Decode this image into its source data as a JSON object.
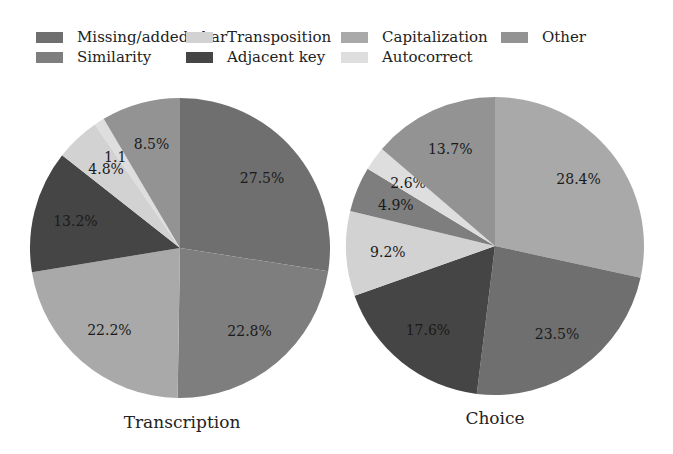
{
  "chart_data": [
    {
      "type": "pie",
      "title": "Transcription",
      "start_angle_deg": 90,
      "direction": "clockwise",
      "slices": [
        {
          "label": "Missing/added char",
          "value": 27.5,
          "text": "27.5%"
        },
        {
          "label": "Similarity",
          "value": 22.8,
          "text": "22.8%"
        },
        {
          "label": "Capitalization",
          "value": 22.2,
          "text": "22.2%"
        },
        {
          "label": "Adjacent key",
          "value": 13.2,
          "text": "13.2%"
        },
        {
          "label": "Transposition",
          "value": 4.8,
          "text": "4.8%"
        },
        {
          "label": "Autocorrect",
          "value": 1.1,
          "text": "1.1%"
        },
        {
          "label": "Other",
          "value": 8.5,
          "text": "8.5%"
        }
      ]
    },
    {
      "type": "pie",
      "title": "Choice",
      "start_angle_deg": 90,
      "direction": "clockwise",
      "slices": [
        {
          "label": "Capitalization",
          "value": 28.4,
          "text": "28.4%"
        },
        {
          "label": "Missing/added char",
          "value": 23.5,
          "text": "23.5%"
        },
        {
          "label": "Adjacent key",
          "value": 17.6,
          "text": "17.6%"
        },
        {
          "label": "Transposition",
          "value": 9.2,
          "text": "9.2%"
        },
        {
          "label": "Similarity",
          "value": 4.9,
          "text": "4.9%"
        },
        {
          "label": "Autocorrect",
          "value": 2.6,
          "text": "2.6%"
        },
        {
          "label": "Other",
          "value": 13.7,
          "text": "13.7%"
        }
      ]
    }
  ],
  "legend": {
    "position": "top",
    "items": [
      {
        "label": "Missing/added char",
        "color": "#6f6f6f"
      },
      {
        "label": "Similarity",
        "color": "#7e7e7e"
      },
      {
        "label": "Transposition",
        "color": "#d2d2d2"
      },
      {
        "label": "Adjacent key",
        "color": "#454545"
      },
      {
        "label": "Capitalization",
        "color": "#a9a9a9"
      },
      {
        "label": "Autocorrect",
        "color": "#dedede"
      },
      {
        "label": "Other",
        "color": "#939393"
      }
    ]
  },
  "titles": {
    "left": "Transcription",
    "right": "Choice"
  }
}
